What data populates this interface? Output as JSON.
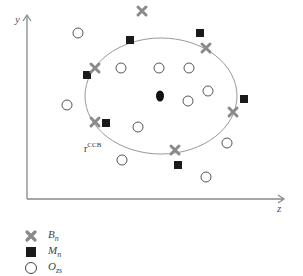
{
  "diagram": {
    "axes": {
      "y_label": "y",
      "x_label": "z",
      "color": "#888888"
    },
    "boundary": {
      "label_main": "r",
      "label_sup": "CCB",
      "center": [
        161,
        96
      ],
      "rx": 76,
      "ry": 58,
      "color": "#999999"
    },
    "center_point": {
      "x": 160,
      "y": 96,
      "color": "#111111"
    },
    "series": {
      "B_n": {
        "symbol": "cross",
        "color": "#8a8a8a",
        "points": [
          [
            142,
            11
          ],
          [
            206,
            48
          ],
          [
            95,
            68
          ],
          [
            95,
            122
          ],
          [
            175,
            150
          ],
          [
            233,
            112
          ]
        ]
      },
      "M_n": {
        "symbol": "square",
        "color": "#1a1a1a",
        "points": [
          [
            130,
            40
          ],
          [
            200,
            33
          ],
          [
            87,
            75
          ],
          [
            106,
            123
          ],
          [
            178,
            165
          ],
          [
            244,
            99
          ]
        ]
      },
      "O_zs": {
        "symbol": "circle",
        "color": "#444444",
        "points": [
          [
            78,
            33
          ],
          [
            121,
            68
          ],
          [
            159,
            68
          ],
          [
            189,
            68
          ],
          [
            67,
            105
          ],
          [
            208,
            91
          ],
          [
            188,
            101
          ],
          [
            138,
            127
          ],
          [
            122,
            160
          ],
          [
            227,
            143
          ],
          [
            206,
            177
          ]
        ]
      }
    }
  },
  "legend": {
    "items": [
      {
        "symbol": "cross",
        "label": "B",
        "sub": "n"
      },
      {
        "symbol": "square",
        "label": "M",
        "sub": "n"
      },
      {
        "symbol": "circle",
        "label": "O",
        "sub": "zs"
      }
    ]
  }
}
